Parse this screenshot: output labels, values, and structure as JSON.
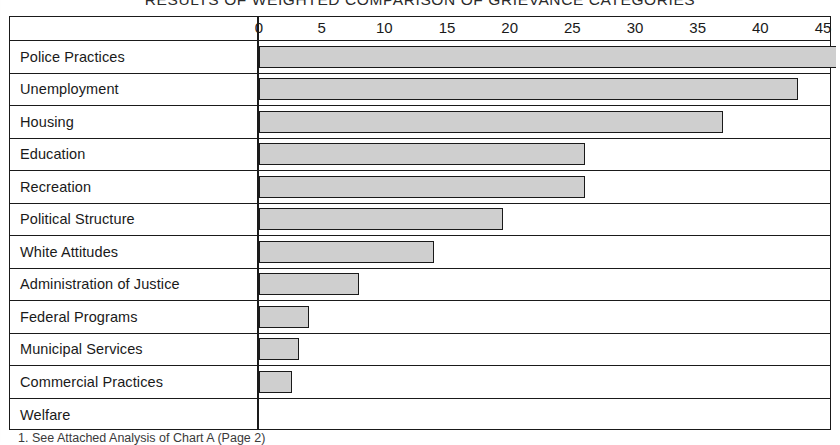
{
  "title": "RESULTS OF WEIGHTED COMPARISON OF GRIEVANCE CATEGORIES",
  "footnote": "1. See Attached Analysis of Chart A (Page 2)",
  "colors": {
    "bar_fill": "#cfcfcf",
    "bar_stroke": "#1a1a1a",
    "frame": "#1a1a1a",
    "background": "#ffffff"
  },
  "chart_data": {
    "type": "bar",
    "orientation": "horizontal",
    "title": "RESULTS OF WEIGHTED COMPARISON OF GRIEVANCE CATEGORIES",
    "xlabel": "",
    "ylabel": "",
    "xlim": [
      0,
      46
    ],
    "xticks": [
      0,
      5,
      10,
      15,
      20,
      25,
      30,
      35,
      40,
      45
    ],
    "grid": false,
    "legend": null,
    "categories": [
      "Police Practices",
      "Unemployment",
      "Housing",
      "Education",
      "Recreation",
      "Political Structure",
      "White Attitudes",
      "Administration of Justice",
      "Federal Programs",
      "Municipal Services",
      "Commercial Practices",
      "Welfare"
    ],
    "values": [
      46,
      43,
      37,
      26,
      26,
      19.5,
      14,
      8,
      4,
      3.2,
      2.6,
      0
    ]
  }
}
